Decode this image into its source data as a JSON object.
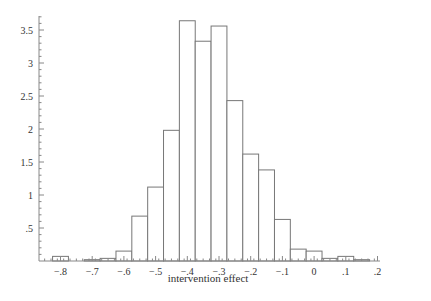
{
  "chart_data": {
    "type": "bar",
    "title": "",
    "xlabel": "intervention effect",
    "ylabel": "",
    "bin_width": 0.05,
    "x": [
      -0.8,
      -0.75,
      -0.7,
      -0.65,
      -0.6,
      -0.55,
      -0.5,
      -0.45,
      -0.4,
      -0.35,
      -0.3,
      -0.25,
      -0.2,
      -0.15,
      -0.1,
      -0.05,
      0.0,
      0.05,
      0.1,
      0.15
    ],
    "values": [
      0.07,
      0.0,
      0.02,
      0.04,
      0.15,
      0.68,
      1.12,
      1.98,
      3.64,
      3.33,
      3.56,
      2.43,
      1.62,
      1.38,
      0.63,
      0.18,
      0.15,
      0.04,
      0.07,
      0.02
    ],
    "xlim": [
      -0.86,
      0.2
    ],
    "ylim": [
      0,
      3.7
    ],
    "xticks": [
      -0.8,
      -0.7,
      -0.6,
      -0.5,
      -0.4,
      -0.3,
      -0.2,
      -0.1,
      0,
      0.1,
      0.2
    ],
    "xtick_labels": [
      "-.8",
      "-.7",
      "-.6",
      "-.5",
      "-.4",
      "-.3",
      "-.2",
      "-.1",
      "0",
      ".1",
      ".2"
    ],
    "yticks": [
      0.5,
      1,
      1.5,
      2,
      2.5,
      3,
      3.5
    ],
    "ytick_labels": [
      ".5",
      "1",
      "1.5",
      "2",
      "2.5",
      "3",
      "3.5"
    ],
    "grid": false,
    "legend": null,
    "bar_fill": "#ffffff",
    "bar_stroke": "#777777"
  }
}
